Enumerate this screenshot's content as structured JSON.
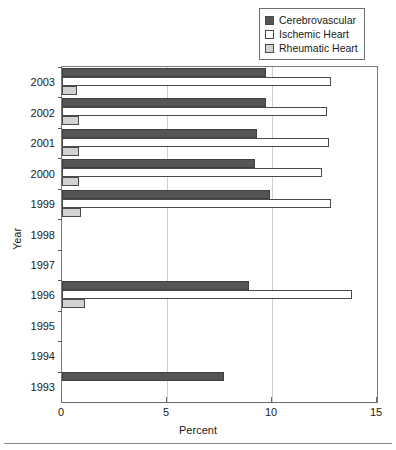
{
  "chart_data": {
    "type": "bar",
    "orientation": "horizontal",
    "title": "",
    "xlabel": "Percent",
    "ylabel": "Year",
    "xlim": [
      0,
      15
    ],
    "xticks": [
      0,
      5,
      10,
      15
    ],
    "xtick_labels": [
      "0",
      "5",
      "10",
      "15"
    ],
    "grid": true,
    "grid_axis": "x",
    "legend_position": "top-right",
    "categories": [
      "2003",
      "2002",
      "2001",
      "2000",
      "1999",
      "1998",
      "1997",
      "1996",
      "1995",
      "1994",
      "1993"
    ],
    "series": [
      {
        "name": "Cerebrovascular",
        "color": "#555555",
        "values": [
          9.7,
          9.7,
          9.3,
          9.2,
          9.9,
          0,
          0,
          8.9,
          0,
          0,
          7.7
        ]
      },
      {
        "name": "Ischemic Heart",
        "color": "#ffffff",
        "values": [
          12.8,
          12.6,
          12.7,
          12.4,
          12.8,
          0,
          0,
          13.8,
          0,
          0,
          0
        ]
      },
      {
        "name": "Rheumatic Heart",
        "color": "#d2d2d2",
        "values": [
          0.7,
          0.8,
          0.8,
          0.8,
          0.9,
          0,
          0,
          1.1,
          0,
          0,
          0
        ]
      }
    ]
  },
  "legend": {
    "items": [
      {
        "label": "Cerebrovascular",
        "color": "#555555"
      },
      {
        "label": "Ischemic Heart",
        "color": "#ffffff"
      },
      {
        "label": "Rheumatic Heart",
        "color": "#d2d2d2"
      }
    ]
  },
  "axes": {
    "x_title": "Percent",
    "y_title": "Year"
  }
}
